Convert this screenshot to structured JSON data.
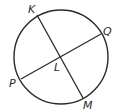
{
  "diagram": {
    "type": "circle-with-intersecting-chords",
    "stroke_color": "#2a2a2a",
    "background": "#ffffff",
    "circle": {
      "cx": 61,
      "cy": 57,
      "r": 47
    },
    "points": {
      "K": {
        "label": "K",
        "x": 37,
        "y": 15,
        "label_x": 28,
        "label_y": 13
      },
      "M": {
        "label": "M",
        "x": 83,
        "y": 98,
        "label_x": 83,
        "label_y": 109
      },
      "Q": {
        "label": "Q",
        "x": 101,
        "y": 34,
        "label_x": 103,
        "label_y": 35
      },
      "P": {
        "label": "P",
        "x": 21,
        "y": 79,
        "label_x": 9,
        "label_y": 87
      },
      "L": {
        "label": "L",
        "x": 60,
        "y": 57,
        "label_x": 54,
        "label_y": 71
      }
    },
    "segments": [
      {
        "name": "KM",
        "from": "K",
        "to": "M"
      },
      {
        "name": "PQ",
        "from": "P",
        "to": "Q"
      }
    ]
  }
}
